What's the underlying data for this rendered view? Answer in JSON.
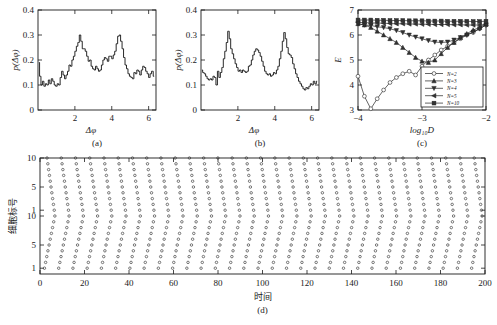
{
  "figure": {
    "panels": [
      {
        "id": "a",
        "label": "(a)"
      },
      {
        "id": "b",
        "label": "(b)"
      },
      {
        "id": "c",
        "label": "(c)"
      },
      {
        "id": "d",
        "label": "(d)"
      }
    ]
  },
  "chart_data": [
    {
      "type": "line",
      "panel": "(a)",
      "title": "",
      "xlabel": "Δφ",
      "ylabel": "p(Δφ)",
      "xlim": [
        0,
        6.4
      ],
      "ylim": [
        0,
        0.4
      ],
      "xticks": [
        2,
        4,
        6
      ],
      "yticks": [
        0,
        0.1,
        0.2,
        0.3,
        0.4
      ],
      "ytick_labels": [
        "0",
        "0.1",
        "0.2",
        "0.3",
        "0.4"
      ],
      "grid": false,
      "legend": "none",
      "x": [
        0.05,
        0.12,
        0.2,
        0.28,
        0.36,
        0.44,
        0.52,
        0.6,
        0.68,
        0.76,
        0.84,
        0.92,
        1.0,
        1.08,
        1.16,
        1.24,
        1.32,
        1.4,
        1.48,
        1.56,
        1.64,
        1.72,
        1.8,
        1.88,
        1.96,
        2.04,
        2.12,
        2.2,
        2.28,
        2.36,
        2.44,
        2.52,
        2.6,
        2.68,
        2.76,
        2.84,
        2.92,
        3.0,
        3.08,
        3.16,
        3.24,
        3.32,
        3.4,
        3.48,
        3.56,
        3.64,
        3.72,
        3.8,
        3.88,
        3.96,
        4.04,
        4.12,
        4.2,
        4.28,
        4.36,
        4.44,
        4.52,
        4.6,
        4.68,
        4.76,
        4.84,
        4.92,
        5.0,
        5.08,
        5.16,
        5.24,
        5.32,
        5.4,
        5.48,
        5.56,
        5.64,
        5.72,
        5.8,
        5.88,
        5.96,
        6.04,
        6.12,
        6.2,
        6.3
      ],
      "values": [
        0.19,
        0.135,
        0.1,
        0.115,
        0.095,
        0.105,
        0.1,
        0.12,
        0.105,
        0.125,
        0.115,
        0.1,
        0.095,
        0.105,
        0.1,
        0.13,
        0.155,
        0.14,
        0.125,
        0.14,
        0.155,
        0.18,
        0.175,
        0.2,
        0.215,
        0.235,
        0.255,
        0.27,
        0.3,
        0.275,
        0.245,
        0.245,
        0.235,
        0.215,
        0.195,
        0.2,
        0.175,
        0.165,
        0.16,
        0.175,
        0.165,
        0.155,
        0.16,
        0.18,
        0.2,
        0.21,
        0.205,
        0.195,
        0.215,
        0.215,
        0.205,
        0.22,
        0.235,
        0.265,
        0.295,
        0.3,
        0.275,
        0.245,
        0.21,
        0.18,
        0.165,
        0.145,
        0.135,
        0.13,
        0.125,
        0.15,
        0.145,
        0.16,
        0.155,
        0.14,
        0.16,
        0.175,
        0.17,
        0.155,
        0.145,
        0.13,
        0.145,
        0.155,
        0.135
      ]
    },
    {
      "type": "line",
      "panel": "(b)",
      "title": "",
      "xlabel": "Δφ",
      "ylabel": "p(Δφ)",
      "xlim": [
        0,
        6.4
      ],
      "ylim": [
        0,
        0.4
      ],
      "xticks": [
        2,
        4,
        6
      ],
      "yticks": [
        0,
        0.1,
        0.2,
        0.3,
        0.4
      ],
      "ytick_labels": [
        "0",
        "0.1",
        "0.2",
        "0.3",
        "0.4"
      ],
      "grid": false,
      "legend": "none",
      "x": [
        0.05,
        0.13,
        0.21,
        0.29,
        0.37,
        0.45,
        0.53,
        0.61,
        0.69,
        0.77,
        0.85,
        0.93,
        1.01,
        1.09,
        1.17,
        1.25,
        1.33,
        1.41,
        1.49,
        1.57,
        1.65,
        1.73,
        1.81,
        1.89,
        1.97,
        2.05,
        2.13,
        2.21,
        2.29,
        2.37,
        2.45,
        2.53,
        2.61,
        2.69,
        2.77,
        2.85,
        2.93,
        3.01,
        3.09,
        3.17,
        3.25,
        3.33,
        3.41,
        3.49,
        3.57,
        3.65,
        3.73,
        3.81,
        3.89,
        3.97,
        4.05,
        4.13,
        4.21,
        4.29,
        4.37,
        4.45,
        4.53,
        4.61,
        4.69,
        4.77,
        4.85,
        4.93,
        5.01,
        5.09,
        5.17,
        5.25,
        5.33,
        5.41,
        5.49,
        5.57,
        5.65,
        5.73,
        5.81,
        5.89,
        5.97,
        6.05,
        6.13,
        6.21,
        6.3
      ],
      "values": [
        0.16,
        0.15,
        0.145,
        0.135,
        0.125,
        0.12,
        0.125,
        0.12,
        0.135,
        0.13,
        0.1,
        0.155,
        0.13,
        0.15,
        0.17,
        0.205,
        0.235,
        0.27,
        0.315,
        0.285,
        0.245,
        0.225,
        0.205,
        0.185,
        0.17,
        0.155,
        0.16,
        0.15,
        0.16,
        0.155,
        0.15,
        0.155,
        0.175,
        0.18,
        0.2,
        0.22,
        0.235,
        0.245,
        0.24,
        0.23,
        0.215,
        0.195,
        0.175,
        0.155,
        0.145,
        0.14,
        0.145,
        0.135,
        0.14,
        0.15,
        0.145,
        0.16,
        0.175,
        0.205,
        0.235,
        0.275,
        0.31,
        0.285,
        0.25,
        0.225,
        0.22,
        0.21,
        0.185,
        0.165,
        0.145,
        0.13,
        0.115,
        0.105,
        0.095,
        0.085,
        0.08,
        0.09,
        0.085,
        0.095,
        0.105,
        0.1,
        0.115,
        0.105,
        0.115
      ]
    },
    {
      "type": "line",
      "panel": "(c)",
      "title": "",
      "xlabel": "log₁₀D",
      "ylabel": "E",
      "xlim": [
        -4,
        -2
      ],
      "ylim": [
        3,
        7
      ],
      "xticks": [
        -4,
        -3,
        -2
      ],
      "xtick_labels": [
        "−4",
        "−3",
        "−2"
      ],
      "yticks": [
        3,
        4,
        5,
        6,
        7
      ],
      "ytick_labels": [
        "3",
        "4",
        "5",
        "6",
        "7"
      ],
      "grid": false,
      "legend": "inside-lower-right",
      "x": [
        -4.0,
        -3.9,
        -3.8,
        -3.7,
        -3.6,
        -3.5,
        -3.4,
        -3.3,
        -3.2,
        -3.1,
        -3.0,
        -2.9,
        -2.8,
        -2.7,
        -2.6,
        -2.5,
        -2.4,
        -2.3,
        -2.2,
        -2.1,
        -2.0
      ],
      "series": [
        {
          "name": "N=2",
          "marker": "circle",
          "values": [
            4.35,
            3.55,
            3.05,
            3.45,
            3.8,
            4.1,
            4.3,
            4.45,
            4.55,
            4.4,
            4.75,
            5.0,
            5.2,
            5.4,
            5.55,
            5.7,
            5.85,
            6.0,
            6.1,
            6.25,
            6.4
          ]
        },
        {
          "name": "N=3",
          "marker": "triangle-up",
          "values": [
            6.45,
            6.4,
            6.3,
            6.15,
            6.0,
            5.85,
            5.7,
            5.5,
            5.3,
            5.1,
            4.95,
            4.9,
            5.0,
            5.25,
            5.5,
            5.7,
            5.9,
            6.05,
            6.2,
            6.3,
            6.45
          ]
        },
        {
          "name": "N=4",
          "marker": "triangle-down",
          "values": [
            6.45,
            6.4,
            6.38,
            6.33,
            6.3,
            6.25,
            6.18,
            6.1,
            6.0,
            5.92,
            5.85,
            5.78,
            5.72,
            5.7,
            5.72,
            5.8,
            5.9,
            6.0,
            6.12,
            6.25,
            6.4
          ]
        },
        {
          "name": "N=5",
          "marker": "triangle-left",
          "values": [
            6.5,
            6.5,
            6.48,
            6.48,
            6.47,
            6.46,
            6.45,
            6.45,
            6.44,
            6.44,
            6.43,
            6.43,
            6.42,
            6.42,
            6.42,
            6.41,
            6.41,
            6.4,
            6.4,
            6.4,
            6.42
          ]
        },
        {
          "name": "N=10",
          "marker": "square",
          "values": [
            6.6,
            6.6,
            6.6,
            6.59,
            6.59,
            6.58,
            6.58,
            6.58,
            6.57,
            6.57,
            6.57,
            6.56,
            6.56,
            6.56,
            6.55,
            6.55,
            6.55,
            6.55,
            6.54,
            6.54,
            6.55
          ]
        }
      ]
    },
    {
      "type": "scatter",
      "panel": "(d)",
      "title": "",
      "xlabel": "时间",
      "ylabel": "细胞标号",
      "xlim": [
        0,
        200
      ],
      "ylim": [
        0,
        20
      ],
      "xticks": [
        0,
        20,
        40,
        60,
        80,
        100,
        120,
        140,
        160,
        180,
        200
      ],
      "ytick_positions": [
        1,
        5,
        10,
        11,
        15,
        20
      ],
      "ytick_labels": [
        "1",
        "5",
        "10",
        "1",
        "5",
        "10"
      ],
      "grid": false,
      "legend": "none",
      "description": "raster plot, two stacked groups of 10 cells, upper group shows descending diagonal wave fronts, lower group ascending diagonal wave fronts",
      "groups": [
        {
          "name": "upper",
          "cells": 10,
          "period": 6.4,
          "slope": -0.36,
          "phase": 0.0
        },
        {
          "name": "lower",
          "cells": 10,
          "period": 6.4,
          "slope": 0.52,
          "phase": 2.0
        }
      ]
    }
  ]
}
